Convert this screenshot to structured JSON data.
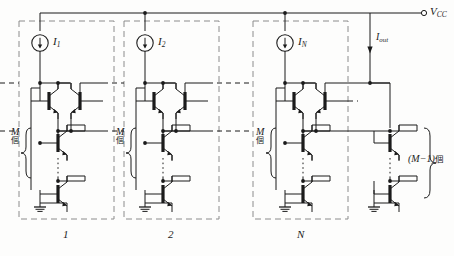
{
  "figure": {
    "type": "circuit-schematic",
    "supply_label": "V",
    "supply_sub": "CC",
    "supply_terminal": "open-circle-terminal"
  },
  "sources": [
    {
      "name": "current-source-1",
      "label": "I",
      "sub": "1",
      "arrow": "down"
    },
    {
      "name": "current-source-2",
      "label": "I",
      "sub": "2",
      "arrow": "down"
    },
    {
      "name": "current-source-n",
      "label": "I",
      "sub": "N",
      "arrow": "down"
    }
  ],
  "output": {
    "label": "I",
    "sub": "out",
    "arrow": "down"
  },
  "cells": [
    {
      "index": 0,
      "label": "1",
      "stack_label": "M",
      "stack_counter": "個"
    },
    {
      "index": 1,
      "label": "2",
      "stack_label": "M",
      "stack_counter": "個"
    },
    {
      "index": 2,
      "label": "N",
      "stack_label": "M",
      "stack_counter": "個"
    }
  ],
  "output_stack": {
    "label": "(M−1)",
    "counter": "個",
    "name": "output-stack-brace-label"
  },
  "colors": {
    "wire": "#1b1b1b",
    "dashed_box": "#8c8c8c",
    "background": "#fdfdfc",
    "text": "#1b1b1b"
  },
  "symbols": {
    "transistor": "npn-bjt",
    "ground": "ground-symbol",
    "source": "circle-with-down-arrow",
    "ellipsis": "vertical-dotted-repeat"
  }
}
